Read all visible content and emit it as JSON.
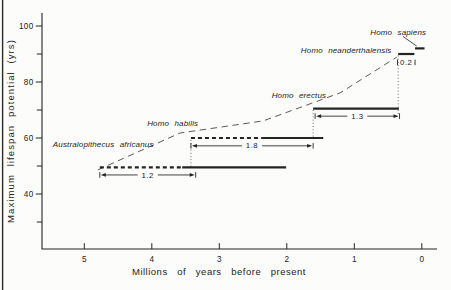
{
  "figure": {
    "kind": "scanned scientific line-interval figure",
    "background_color": "#fcfcfa",
    "ink_color": "#242424",
    "trend_color": "#3f3f3f",
    "connector_color": "#555555",
    "scan_edge_line": true
  },
  "chart_data": {
    "type": "bar",
    "subtype": "horizontal interval timeline of hominid maximum lifespan potential",
    "title": "",
    "xlabel": "Millions of years before present",
    "ylabel": "Maximum lifespan potential (yrs)",
    "grid": false,
    "legend": "none",
    "x_axis": {
      "ticks": [
        5,
        4,
        3,
        2,
        1,
        0
      ],
      "reversed": true,
      "units": "millions of years",
      "range": [
        5.6,
        -0.2
      ]
    },
    "y_axis": {
      "major_ticks": [
        100,
        80,
        60,
        40
      ],
      "minor_ticks": [
        90,
        70,
        50,
        30
      ],
      "units": "yrs",
      "range": [
        20,
        104
      ]
    },
    "species": [
      {
        "name": "Australopithecus africanus",
        "max_lifespan_yrs": 49.5,
        "dashed_span_ma": [
          4.77,
          3.55
        ],
        "solid_span_ma": [
          3.55,
          2.01
        ],
        "duration_label": "1.2",
        "duration_span_ma": [
          4.77,
          3.35
        ],
        "duration_level_yrs": 46.8,
        "duration_style": "arrow",
        "label_anchor": {
          "ma": 4.72,
          "yrs": 56.8
        }
      },
      {
        "name": "Homo habilis",
        "max_lifespan_yrs": 60,
        "dashed_span_ma": [
          3.42,
          2.37
        ],
        "solid_span_ma": [
          2.37,
          1.46
        ],
        "duration_label": "1.8",
        "duration_span_ma": [
          3.42,
          1.61
        ],
        "duration_level_yrs": 57.2,
        "duration_style": "arrow",
        "label_anchor": {
          "ma": 3.69,
          "yrs": 64.3
        }
      },
      {
        "name": "Homo erectus",
        "max_lifespan_yrs": 70.5,
        "solid_span_ma": [
          1.61,
          0.34
        ],
        "duration_label": "1.3",
        "duration_span_ma": [
          1.58,
          0.33
        ],
        "duration_level_yrs": 67.8,
        "duration_style": "arrow",
        "label_anchor": {
          "ma": 1.82,
          "yrs": 74.3
        }
      },
      {
        "name": "Homo neanderthalensis",
        "max_lifespan_yrs": 90,
        "solid_span_ma": [
          0.35,
          0.11
        ],
        "duration_label": "0.2",
        "duration_span_ma": [
          0.36,
          0.1
        ],
        "duration_level_yrs": 87,
        "duration_style": "bracket",
        "label_anchor": {
          "ma": 1.12,
          "yrs": 90.4
        }
      },
      {
        "name": "Homo sapiens",
        "max_lifespan_yrs": 92,
        "solid_span_ma": [
          0.1,
          -0.04
        ],
        "label_anchor": {
          "ma": 0.35,
          "yrs": 96.8
        },
        "pointer_line_ma_yrs": [
          [
            0.28,
            96.3
          ],
          [
            0.075,
            92.8
          ]
        ]
      }
    ],
    "trend_line": {
      "style": "dashed",
      "points_ma_yrs": [
        [
          4.8,
          48.6
        ],
        [
          3.58,
          61.8
        ],
        [
          2.35,
          66.1
        ],
        [
          1.21,
          76.1
        ],
        [
          0.37,
          88.9
        ]
      ]
    },
    "connectors_dotted": [
      {
        "ma": 3.42,
        "yrs_span": [
          59.3,
          49.8
        ]
      },
      {
        "ma": 1.61,
        "yrs_span": [
          70.0,
          60.3
        ]
      },
      {
        "ma": 0.35,
        "yrs_span": [
          89.5,
          67.8
        ]
      }
    ]
  }
}
